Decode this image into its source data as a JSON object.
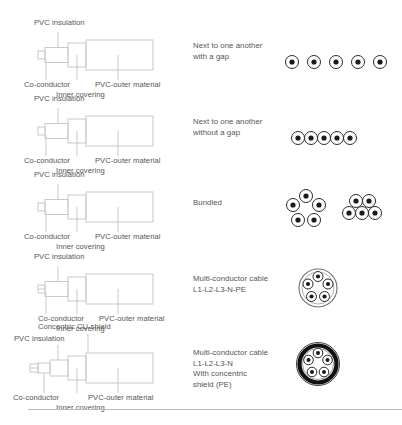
{
  "figure": {
    "line_color": "#c9c9c9",
    "text_color": "#555555",
    "dot_color": "#1a1a1a",
    "shield_color": "#111111"
  },
  "common_labels": {
    "pvc_insulation": "PVC insulation",
    "co_conductor": "Co-conductor",
    "inner_covering": "Inner covering",
    "pvc_outer_material": "PVC-outer material",
    "concentric_cu_shield": "Concentric CU-shield"
  },
  "rows": [
    {
      "id": "next-to-one-another-with-gap",
      "description": "Next to one another\nwith a gap",
      "has_shield_label": false,
      "symbol": "five-circles-spaced"
    },
    {
      "id": "next-to-one-another-without-gap",
      "description": "Next to one another\nwithout a gap",
      "has_shield_label": false,
      "symbol": "five-circles-touching"
    },
    {
      "id": "bundled",
      "description": "Bundled",
      "has_shield_label": false,
      "symbol": "two-bundles"
    },
    {
      "id": "multi-conductor-cable",
      "description": "Multi-conductor cable\nL1-L2-L3-N-PE",
      "has_shield_label": false,
      "symbol": "multicore-five"
    },
    {
      "id": "multi-conductor-cable-shielded",
      "description": "Multi-conductor cable\nL1-L2-L3-N\nWith concentric\nshield (PE)",
      "has_shield_label": true,
      "symbol": "multicore-five-shielded"
    }
  ],
  "footnote": ""
}
